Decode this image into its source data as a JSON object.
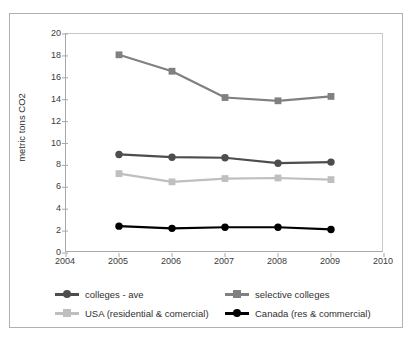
{
  "chart_data": {
    "type": "line",
    "title": "",
    "xlabel": "",
    "ylabel": "metric tons CO2",
    "x": [
      2005,
      2006,
      2007,
      2008,
      2009
    ],
    "xlim": [
      2004,
      2010
    ],
    "ylim": [
      0,
      20
    ],
    "xticks": [
      2004,
      2005,
      2006,
      2007,
      2008,
      2009,
      2010
    ],
    "xtick_labels": [
      "2004",
      "2005",
      "2006",
      "2007",
      "2008",
      "2009",
      "2010"
    ],
    "yticks": [
      0,
      2,
      4,
      6,
      8,
      10,
      12,
      14,
      16,
      18,
      20
    ],
    "ytick_labels": [
      "0",
      "2",
      "4",
      "6",
      "8",
      "10",
      "12",
      "14",
      "16",
      "18",
      "20"
    ],
    "grid": false,
    "legend_position": "bottom",
    "series": [
      {
        "name": "colleges - ave",
        "values": [
          9.0,
          8.75,
          8.7,
          8.2,
          8.3
        ],
        "color": "#4d4d4d",
        "marker": "circle"
      },
      {
        "name": "selective colleges",
        "values": [
          18.1,
          16.6,
          14.2,
          13.9,
          14.3
        ],
        "color": "#808080",
        "marker": "square"
      },
      {
        "name": "USA (residential & comercial)",
        "values": [
          7.25,
          6.5,
          6.8,
          6.85,
          6.7
        ],
        "color": "#bfbfbf",
        "marker": "square"
      },
      {
        "name": "Canada (res & commercial)",
        "values": [
          2.45,
          2.25,
          2.35,
          2.35,
          2.15
        ],
        "color": "#000000",
        "marker": "circle"
      }
    ]
  },
  "axis": {
    "y_title": "metric tons CO2"
  },
  "legend": {
    "items": [
      {
        "label": "colleges - ave",
        "color": "#4d4d4d",
        "marker": "circle"
      },
      {
        "label": "selective colleges",
        "color": "#808080",
        "marker": "square"
      },
      {
        "label": "USA (residential & comercial)",
        "color": "#bfbfbf",
        "marker": "square"
      },
      {
        "label": "Canada (res & commercial)",
        "color": "#000000",
        "marker": "circle"
      }
    ]
  }
}
